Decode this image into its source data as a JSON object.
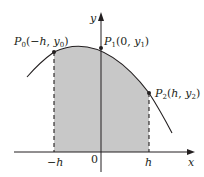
{
  "diagram": {
    "type": "area-under-curve",
    "colors": {
      "shade": "#c8c8c8",
      "line": "#231f20",
      "background": "#ffffff"
    },
    "axes": {
      "x_label": "x",
      "y_label": "y",
      "origin_label": "0"
    },
    "ticks": [
      {
        "label": "−h",
        "position": "-h"
      },
      {
        "label": "0",
        "position": "0"
      },
      {
        "label": "h",
        "position": "h"
      }
    ],
    "points": [
      {
        "name": "P",
        "sub": "0",
        "coords_pre": "(−",
        "var1": "h",
        "sep": ", ",
        "var2": "y",
        "var2_sub": "0",
        "close": ")"
      },
      {
        "name": "P",
        "sub": "1",
        "coords_pre": "(0, ",
        "var2": "y",
        "var2_sub": "1",
        "close": ")"
      },
      {
        "name": "P",
        "sub": "2",
        "coords_pre": "(",
        "var1": "h",
        "sep": ", ",
        "var2": "y",
        "var2_sub": "2",
        "close": ")"
      }
    ]
  }
}
